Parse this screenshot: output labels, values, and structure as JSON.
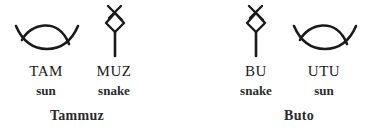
{
  "groups": [
    {
      "name": "Tammuz",
      "signs": [
        {
          "icon": "sun-sign-icon",
          "reading": "TAM",
          "meaning": "sun"
        },
        {
          "icon": "snake-sign-icon",
          "reading": "MUZ",
          "meaning": "snake"
        }
      ]
    },
    {
      "name": "Buto",
      "signs": [
        {
          "icon": "snake-sign-icon",
          "reading": "BU",
          "meaning": "snake"
        },
        {
          "icon": "sun-sign-icon",
          "reading": "UTU",
          "meaning": "sun"
        }
      ]
    }
  ],
  "colors": {
    "ink": "#1a1a1a",
    "background": "#ffffff"
  }
}
